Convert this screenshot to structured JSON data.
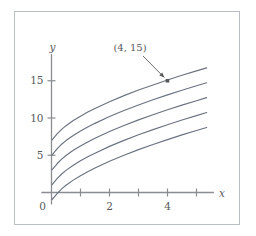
{
  "chart_data": {
    "type": "line",
    "title": "",
    "xlabel": "x",
    "ylabel": "y",
    "xlim": [
      -0.35,
      5.6
    ],
    "ylim": [
      -1.6,
      18.6
    ],
    "grid": false,
    "legend": null,
    "x_ticks": [
      1,
      2,
      3,
      4,
      5
    ],
    "x_tick_labels": [
      "",
      "2",
      "",
      "4",
      ""
    ],
    "y_ticks": [
      5,
      10,
      15
    ],
    "y_tick_labels": [
      "5",
      "10",
      "15"
    ],
    "origin_label": "0",
    "annotations": [
      {
        "text": "(4, 15)",
        "point_x": 4,
        "point_y": 15,
        "marker": "square"
      }
    ],
    "series": [
      {
        "name": "curve-1",
        "constant": 9.0,
        "x": [
          0.02,
          0.1,
          0.2,
          0.35,
          0.5,
          0.75,
          1.0,
          1.25,
          1.5,
          2.0,
          2.5,
          3.0,
          3.5,
          4.0,
          4.5,
          5.0,
          5.35
        ],
        "y": [
          7.06,
          7.42,
          7.89,
          8.48,
          8.97,
          9.66,
          10.25,
          10.79,
          11.28,
          12.19,
          13.0,
          13.75,
          14.44,
          15.1,
          15.73,
          16.32,
          16.73
        ]
      },
      {
        "name": "curve-2",
        "constant": 7.0,
        "x": [
          0.02,
          0.1,
          0.2,
          0.35,
          0.5,
          0.75,
          1.0,
          1.25,
          1.5,
          2.0,
          2.5,
          3.0,
          3.5,
          4.0,
          4.5,
          5.0,
          5.35
        ],
        "y": [
          5.06,
          5.42,
          5.89,
          6.48,
          6.97,
          7.66,
          8.25,
          8.79,
          9.28,
          10.19,
          11.0,
          11.75,
          12.44,
          13.1,
          13.73,
          14.32,
          14.73
        ]
      },
      {
        "name": "curve-3",
        "constant": 5.0,
        "x": [
          0.02,
          0.1,
          0.2,
          0.35,
          0.5,
          0.75,
          1.0,
          1.25,
          1.5,
          2.0,
          2.5,
          3.0,
          3.5,
          4.0,
          4.5,
          5.0,
          5.35
        ],
        "y": [
          3.06,
          3.42,
          3.89,
          4.48,
          4.97,
          5.66,
          6.25,
          6.79,
          7.28,
          8.19,
          9.0,
          9.75,
          10.44,
          11.1,
          11.73,
          12.32,
          12.73
        ]
      },
      {
        "name": "curve-4",
        "constant": 3.0,
        "x": [
          0.02,
          0.1,
          0.2,
          0.35,
          0.5,
          0.75,
          1.0,
          1.25,
          1.5,
          2.0,
          2.5,
          3.0,
          3.5,
          4.0,
          4.5,
          5.0,
          5.35
        ],
        "y": [
          1.06,
          1.42,
          1.89,
          2.48,
          2.97,
          3.66,
          4.25,
          4.79,
          5.28,
          6.19,
          7.0,
          7.75,
          8.44,
          9.1,
          9.73,
          10.32,
          10.73
        ]
      },
      {
        "name": "curve-5",
        "constant": 1.0,
        "x": [
          0.02,
          0.1,
          0.2,
          0.35,
          0.5,
          0.75,
          1.0,
          1.25,
          1.5,
          2.0,
          2.5,
          3.0,
          3.5,
          4.0,
          4.5,
          5.0,
          5.35
        ],
        "y": [
          -0.94,
          -0.58,
          -0.11,
          0.48,
          0.97,
          1.66,
          2.25,
          2.79,
          3.28,
          4.19,
          5.0,
          5.75,
          6.44,
          7.1,
          7.73,
          8.32,
          8.73
        ]
      }
    ]
  },
  "colors": {
    "curve": "#6b7280",
    "axis": "#8a8d91",
    "text": "#58595b",
    "frame": "#b9bec4",
    "background": "#ffffff"
  }
}
